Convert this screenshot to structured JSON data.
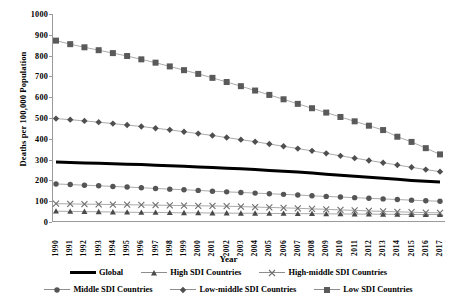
{
  "chart": {
    "type": "line",
    "title": "",
    "xlabel": "Year",
    "ylabel": "Deaths per 100,000 Population",
    "ylim": [
      0,
      1000
    ],
    "y_ticks": [
      0,
      100,
      200,
      300,
      400,
      500,
      600,
      700,
      800,
      900,
      1000
    ],
    "grid": false,
    "legend_position": "bottom"
  },
  "chart_data": {
    "type": "line",
    "title": "",
    "xlabel": "Year",
    "ylabel": "Deaths per 100,000 Population",
    "ylim": [
      0,
      1000
    ],
    "grid": false,
    "legend_position": "bottom",
    "x": [
      1990,
      1991,
      1992,
      1993,
      1994,
      1995,
      1996,
      1997,
      1998,
      1999,
      2000,
      2001,
      2002,
      2003,
      2004,
      2005,
      2006,
      2007,
      2008,
      2009,
      2010,
      2011,
      2012,
      2013,
      2014,
      2015,
      2016,
      2017
    ],
    "categories": [
      "1990",
      "1991",
      "1992",
      "1993",
      "1994",
      "1995",
      "1996",
      "1997",
      "1998",
      "1999",
      "2000",
      "2001",
      "2002",
      "2003",
      "2004",
      "2005",
      "2006",
      "2007",
      "2008",
      "2009",
      "2010",
      "2011",
      "2012",
      "2013",
      "2014",
      "2015",
      "2016",
      "2017"
    ],
    "series": [
      {
        "name": "Global",
        "marker": "none",
        "line": "thick-solid",
        "color": "#000000",
        "values": [
          288,
          286,
          284,
          282,
          280,
          278,
          276,
          273,
          271,
          268,
          265,
          262,
          259,
          256,
          252,
          248,
          244,
          240,
          235,
          230,
          225,
          220,
          215,
          210,
          205,
          200,
          196,
          192
        ]
      },
      {
        "name": "High SDI Countries",
        "marker": "triangle",
        "line": "thin-solid",
        "color": "#4a4a4a",
        "values": [
          52,
          51,
          50,
          49,
          48,
          47,
          46,
          46,
          45,
          44,
          44,
          43,
          43,
          42,
          42,
          41,
          41,
          40,
          40,
          39,
          39,
          38,
          38,
          37,
          37,
          36,
          36,
          36
        ]
      },
      {
        "name": "High-middle SDI Countries",
        "marker": "cross",
        "line": "thin-solid",
        "color": "#6e6e6e",
        "values": [
          88,
          87,
          86,
          85,
          84,
          83,
          82,
          81,
          80,
          79,
          78,
          77,
          76,
          74,
          72,
          70,
          68,
          66,
          63,
          61,
          58,
          56,
          53,
          51,
          49,
          47,
          45,
          44
        ]
      },
      {
        "name": "Middle SDI Countries",
        "marker": "circle",
        "line": "thin-solid",
        "color": "#555555",
        "values": [
          183,
          180,
          177,
          174,
          171,
          168,
          165,
          161,
          158,
          155,
          152,
          148,
          145,
          142,
          139,
          136,
          133,
          130,
          126,
          123,
          120,
          117,
          114,
          111,
          108,
          105,
          102,
          100
        ]
      },
      {
        "name": "Low-middle SDI Countries",
        "marker": "diamond",
        "line": "thin-solid",
        "color": "#4f4f4f",
        "values": [
          497,
          492,
          486,
          480,
          473,
          466,
          459,
          451,
          443,
          434,
          425,
          416,
          406,
          396,
          386,
          375,
          364,
          353,
          342,
          330,
          318,
          307,
          296,
          285,
          274,
          263,
          252,
          242
        ]
      },
      {
        "name": "Low SDI Countries",
        "marker": "square",
        "line": "thin-solid",
        "color": "#5a5a5a",
        "values": [
          872,
          855,
          840,
          826,
          812,
          798,
          782,
          766,
          748,
          730,
          712,
          693,
          673,
          653,
          632,
          611,
          590,
          568,
          547,
          526,
          505,
          484,
          463,
          442,
          410,
          385,
          355,
          325
        ]
      }
    ]
  }
}
